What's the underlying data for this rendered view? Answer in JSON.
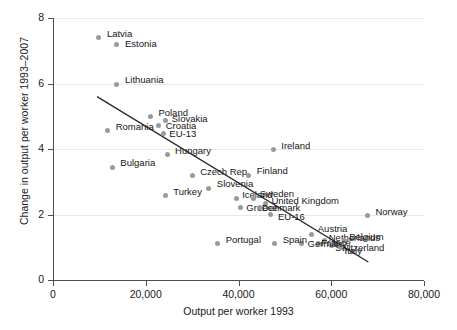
{
  "chart_data": {
    "type": "scatter",
    "title": "",
    "xlabel": "Output per worker 1993",
    "ylabel": "Change in output per worker 1993–2007",
    "xlim": [
      0,
      80000
    ],
    "ylim": [
      0,
      8
    ],
    "xticks": [
      0,
      20000,
      40000,
      60000,
      80000
    ],
    "xticklabels": [
      "0",
      "20,000",
      "40,000",
      "60,000",
      "80,000"
    ],
    "yticks": [
      0,
      2,
      4,
      6,
      8
    ],
    "yticklabels": [
      "0",
      "2",
      "4",
      "6",
      "8"
    ],
    "grid": "horizontal",
    "legend": "none",
    "marker_color": "#9a9a9a",
    "fit_line_color": "#2b2b2b",
    "fit_line": {
      "label": "linear fit",
      "x_start": 9500,
      "y_start": 5.6,
      "x_end": 68000,
      "y_end": 0.55
    },
    "points": [
      {
        "label": "Latvia",
        "x": 9900,
        "y": 7.4,
        "label_dx": 8,
        "label_dy": -4
      },
      {
        "label": "Estonia",
        "x": 13800,
        "y": 7.2,
        "label_dx": 8,
        "label_dy": 0
      },
      {
        "label": "Lithuania",
        "x": 13800,
        "y": 5.98,
        "label_dx": 8,
        "label_dy": -4
      },
      {
        "label": "Poland",
        "x": 21000,
        "y": 4.98,
        "label_dx": 8,
        "label_dy": -4
      },
      {
        "label": "Slovakia",
        "x": 24300,
        "y": 4.86,
        "label_dx": 6,
        "label_dy": -2
      },
      {
        "label": "Croatia",
        "x": 22800,
        "y": 4.72,
        "label_dx": 7,
        "label_dy": 1
      },
      {
        "label": "Romania",
        "x": 11800,
        "y": 4.55,
        "label_dx": 8,
        "label_dy": -4
      },
      {
        "label": "EU-13",
        "x": 23800,
        "y": 4.48,
        "label_dx": 6,
        "label_dy": 1
      },
      {
        "label": "Hungary",
        "x": 24600,
        "y": 3.82,
        "label_dx": 8,
        "label_dy": -4
      },
      {
        "label": "Bulgaria",
        "x": 12800,
        "y": 3.44,
        "label_dx": 8,
        "label_dy": -4
      },
      {
        "label": "Czech Rep.",
        "x": 30000,
        "y": 3.18,
        "label_dx": 8,
        "label_dy": -4
      },
      {
        "label": "Ireland",
        "x": 47500,
        "y": 3.98,
        "label_dx": 8,
        "label_dy": -4
      },
      {
        "label": "Finland",
        "x": 42200,
        "y": 3.2,
        "label_dx": 8,
        "label_dy": -4
      },
      {
        "label": "Slovenia",
        "x": 33600,
        "y": 2.8,
        "label_dx": 8,
        "label_dy": -4
      },
      {
        "label": "Turkey",
        "x": 24200,
        "y": 2.58,
        "label_dx": 8,
        "label_dy": -4
      },
      {
        "label": "Iceland",
        "x": 39500,
        "y": 2.48,
        "label_dx": 6,
        "label_dy": -4
      },
      {
        "label": "Sweden",
        "x": 43300,
        "y": 2.48,
        "label_dx": 6,
        "label_dy": -5
      },
      {
        "label": "United Kingdom",
        "x": 45800,
        "y": 2.35,
        "label_dx": 6,
        "label_dy": -2
      },
      {
        "label": "Greece",
        "x": 40400,
        "y": 2.22,
        "label_dx": 6,
        "label_dy": 1
      },
      {
        "label": "Denmark",
        "x": 44600,
        "y": 2.22,
        "label_dx": 2,
        "label_dy": 1
      },
      {
        "label": "EU-16",
        "x": 47000,
        "y": 2.0,
        "label_dx": 7,
        "label_dy": 2
      },
      {
        "label": "Norway",
        "x": 67800,
        "y": 1.96,
        "label_dx": 8,
        "label_dy": -4
      },
      {
        "label": "Austria",
        "x": 55800,
        "y": 1.38,
        "label_dx": 6,
        "label_dy": -6
      },
      {
        "label": "Netherlands",
        "x": 58600,
        "y": 1.2,
        "label_dx": 4,
        "label_dy": -3
      },
      {
        "label": "Belgium",
        "x": 62800,
        "y": 1.22,
        "label_dx": 5,
        "label_dy": -3
      },
      {
        "label": "France",
        "x": 57200,
        "y": 1.12,
        "label_dx": 3,
        "label_dy": 0
      },
      {
        "label": "Switzerland",
        "x": 60000,
        "y": 1.05,
        "label_dx": 4,
        "label_dy": 2
      },
      {
        "label": "Italy",
        "x": 62000,
        "y": 0.98,
        "label_dx": 4,
        "label_dy": 3
      },
      {
        "label": "Germany",
        "x": 53600,
        "y": 1.1,
        "label_dx": 6,
        "label_dy": 0
      },
      {
        "label": "Spain",
        "x": 47800,
        "y": 1.12,
        "label_dx": 8,
        "label_dy": -3
      },
      {
        "label": "Portugal",
        "x": 35500,
        "y": 1.12,
        "label_dx": 8,
        "label_dy": -3
      }
    ]
  }
}
